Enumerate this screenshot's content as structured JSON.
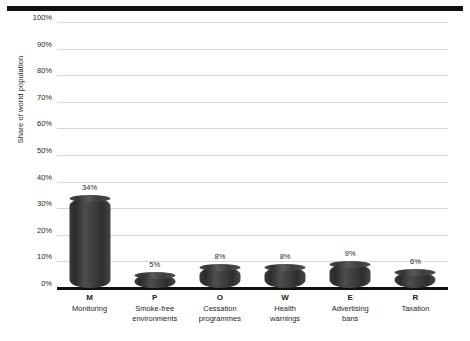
{
  "chart_data": {
    "type": "bar",
    "title": "",
    "xlabel": "",
    "ylabel": "Share of world population",
    "ylim": [
      0,
      100
    ],
    "ytick_labels": [
      "100%",
      "90%",
      "80%",
      "70%",
      "60%",
      "50%",
      "40%",
      "30%",
      "20%",
      "10%",
      "0%"
    ],
    "ytick_values": [
      100,
      90,
      80,
      70,
      60,
      50,
      40,
      30,
      20,
      10,
      0
    ],
    "grid": true,
    "legend": "none",
    "categories": [
      "M",
      "P",
      "O",
      "W",
      "E",
      "R"
    ],
    "category_descriptions": [
      "Monitoring",
      "Smoke-free environments",
      "Cessation programmes",
      "Health warnings",
      "Advertising bans",
      "Taxation"
    ],
    "values": [
      34,
      5,
      8,
      8,
      9,
      6
    ],
    "value_labels": [
      "34%",
      "5%",
      "8%",
      "8%",
      "9%",
      "6%"
    ],
    "bar_color": "#3d3d3d",
    "grid_color": "#d9d9d9",
    "axis_color": "#111111",
    "text_color": "#231f20"
  },
  "axis": {
    "y_title": "Share of world population"
  },
  "x_categories": [
    {
      "letter": "M",
      "line1": "Monitoring",
      "line2": ""
    },
    {
      "letter": "P",
      "line1": "Smoke-free",
      "line2": "environments"
    },
    {
      "letter": "O",
      "line1": "Cessation",
      "line2": "programmes"
    },
    {
      "letter": "W",
      "line1": "Health",
      "line2": "warnings"
    },
    {
      "letter": "E",
      "line1": "Advertising",
      "line2": "bans"
    },
    {
      "letter": "R",
      "line1": "Taxation",
      "line2": ""
    }
  ]
}
